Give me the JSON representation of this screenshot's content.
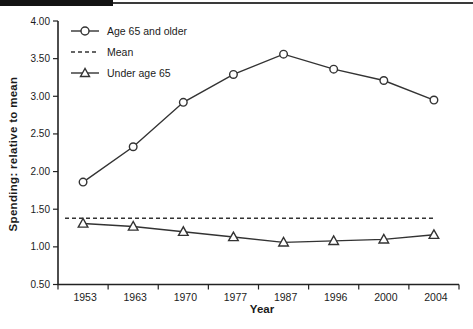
{
  "colors": {
    "ink": "#222222",
    "line": "#333333",
    "marker_fill": "#ffffff",
    "header_bar": "#141414",
    "background": "#ffffff"
  },
  "chart_data": {
    "type": "line",
    "categories": [
      "1953",
      "1963",
      "1970",
      "1977",
      "1987",
      "1996",
      "2000",
      "2004"
    ],
    "series": [
      {
        "name": "Age 65 and older",
        "marker": "circle",
        "line": "solid",
        "values": [
          1.86,
          2.33,
          2.92,
          3.29,
          3.56,
          3.36,
          3.21,
          2.95
        ]
      },
      {
        "name": "Mean",
        "marker": "none",
        "line": "dashed",
        "values": [
          1.38,
          1.38,
          1.38,
          1.38,
          1.38,
          1.38,
          1.38,
          1.38
        ]
      },
      {
        "name": "Under age 65",
        "marker": "triangle",
        "line": "solid",
        "values": [
          1.31,
          1.27,
          1.2,
          1.13,
          1.06,
          1.08,
          1.1,
          1.16
        ]
      }
    ],
    "title": "",
    "xlabel": "Year",
    "ylabel": "Spending: relative to mean",
    "ylim": [
      0.5,
      4.0
    ],
    "ytick_step": 0.5,
    "ytick_format_decimals": 2,
    "grid": false,
    "legend_position": "top-left"
  }
}
